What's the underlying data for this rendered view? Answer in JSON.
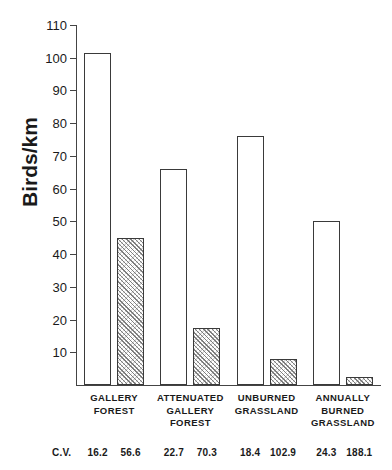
{
  "chart_data": {
    "type": "bar",
    "title": "",
    "xlabel": "",
    "ylabel": "Birds/km",
    "ylim": [
      0,
      110
    ],
    "yticks": [
      10,
      20,
      30,
      40,
      50,
      60,
      70,
      80,
      90,
      100,
      110
    ],
    "grid": false,
    "legend": "none",
    "categories": [
      "GALLERY\nFOREST",
      "ATTENUATED\nGALLERY\nFOREST",
      "UNBURNED\nGRASSLAND",
      "ANNUALLY\nBURNED\nGRASSLAND"
    ],
    "category_lines": [
      [
        "GALLERY",
        "FOREST"
      ],
      [
        "ATTENUATED",
        "GALLERY",
        "FOREST"
      ],
      [
        "UNBURNED",
        "GRASSLAND"
      ],
      [
        "ANNUALLY",
        "BURNED",
        "GRASSLAND"
      ]
    ],
    "series": [
      {
        "name": "open",
        "fill": "white",
        "values": [
          101.5,
          66.0,
          76.0,
          50.0
        ]
      },
      {
        "name": "hatched",
        "fill": "hatched",
        "values": [
          45.0,
          17.5,
          8.0,
          2.5
        ]
      }
    ],
    "annotations": {
      "cv_label": "C.V.",
      "cv_values": [
        [
          16.2,
          56.6
        ],
        [
          22.7,
          70.3
        ],
        [
          18.4,
          102.9
        ],
        [
          24.3,
          188.1
        ]
      ]
    }
  },
  "axis": {
    "ytick_labels": [
      "10",
      "20",
      "30",
      "40",
      "50",
      "60",
      "70",
      "80",
      "90",
      "100",
      "110"
    ]
  },
  "labels": {
    "y_axis_title": "Birds/km",
    "cv_title": "C.V."
  },
  "colors": {
    "axis": "#444444",
    "bar_outline": "#3a3a3a",
    "bar_open_fill": "#ffffff",
    "bar_hatch_fill": "#c9c9c9",
    "text": "#1a1a1a",
    "background": "#ffffff"
  }
}
